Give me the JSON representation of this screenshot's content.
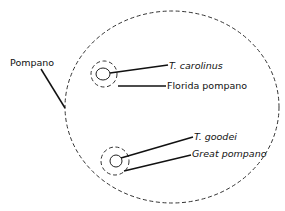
{
  "diagram": {
    "type": "nested-set-diagram",
    "outer_set": {
      "label": "Pompano",
      "style": "dashed-ellipse"
    },
    "groups": [
      {
        "species_label": "T. carolinus",
        "common_label": "Florida pompano",
        "species_italic": true,
        "common_italic": false
      },
      {
        "species_label": "T. goodei",
        "common_label": "Great pompano",
        "species_italic": true,
        "common_italic": true
      }
    ],
    "colors": {
      "background": "#ffffff",
      "stroke": "#222222",
      "text": "#111111"
    }
  }
}
